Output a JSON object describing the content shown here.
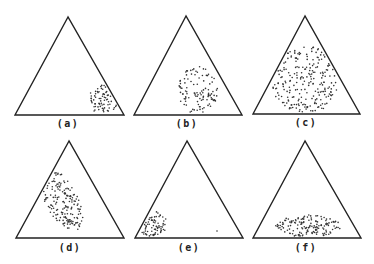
{
  "figure": {
    "background": "#ffffff",
    "line_color": "#222222",
    "dot_color": "#333333",
    "panels": [
      {
        "id": "a",
        "label": "(a)",
        "apex": [
          68,
          17
        ],
        "base_left": [
          15,
          115
        ],
        "base_right": [
          124,
          115
        ],
        "label_pos": [
          68,
          127
        ],
        "cluster": {
          "shape": "ellipse",
          "center": [
            104,
            100
          ],
          "rx": 16,
          "ry": 15,
          "angle": 0,
          "count": 70,
          "seed": 11
        },
        "extra_dots": []
      },
      {
        "id": "b",
        "label": "(b)",
        "apex": [
          186,
          16
        ],
        "base_left": [
          134,
          115
        ],
        "base_right": [
          242,
          115
        ],
        "label_pos": [
          187,
          127
        ],
        "cluster": {
          "shape": "ellipse",
          "center": [
            198,
            90
          ],
          "rx": 20,
          "ry": 24,
          "angle": 0,
          "count": 110,
          "seed": 23
        },
        "extra_dots": []
      },
      {
        "id": "c",
        "label": "(c)",
        "apex": [
          305,
          16
        ],
        "base_left": [
          253,
          114
        ],
        "base_right": [
          360,
          114
        ],
        "label_pos": [
          306,
          126
        ],
        "cluster": {
          "shape": "ellipse",
          "center": [
            305,
            80
          ],
          "rx": 34,
          "ry": 34,
          "angle": 0,
          "count": 230,
          "seed": 37
        },
        "extra_dots": []
      },
      {
        "id": "d",
        "label": "(d)",
        "apex": [
          69,
          141
        ],
        "base_left": [
          16,
          238
        ],
        "base_right": [
          124,
          238
        ],
        "label_pos": [
          70,
          251
        ],
        "cluster": {
          "shape": "ellipse",
          "center": [
            60,
            198
          ],
          "rx": 16,
          "ry": 36,
          "angle": 30,
          "count": 170,
          "seed": 41
        },
        "extra_dots": []
      },
      {
        "id": "e",
        "label": "(e)",
        "apex": [
          187,
          141
        ],
        "base_left": [
          135,
          238
        ],
        "base_right": [
          243,
          238
        ],
        "label_pos": [
          189,
          251
        ],
        "cluster": {
          "shape": "ellipse",
          "center": [
            152,
            224
          ],
          "rx": 15,
          "ry": 13,
          "angle": 0,
          "count": 75,
          "seed": 53
        },
        "extra_dots": [
          [
            217,
            231
          ]
        ]
      },
      {
        "id": "f",
        "label": "(f)",
        "apex": [
          305,
          141
        ],
        "base_left": [
          253,
          238
        ],
        "base_right": [
          361,
          238
        ],
        "label_pos": [
          306,
          251
        ],
        "cluster": {
          "shape": "ellipse",
          "center": [
            308,
            226
          ],
          "rx": 33,
          "ry": 11,
          "angle": 0,
          "count": 150,
          "seed": 67
        },
        "extra_dots": []
      }
    ]
  }
}
